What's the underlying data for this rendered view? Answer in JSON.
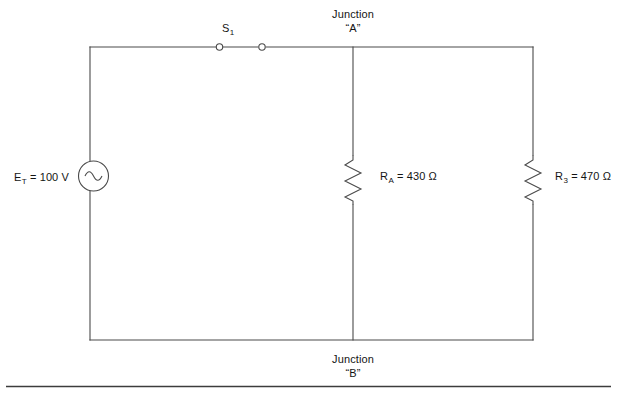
{
  "diagram": {
    "line_color": "#4a4a4a",
    "text_color": "#141414",
    "background": "#ffffff",
    "junctions": {
      "top": {
        "name_line": "Junction",
        "label_line": "“A”"
      },
      "bottom": {
        "name_line": "Junction",
        "label_line": "“B”"
      }
    },
    "source": {
      "symbol": "ac-source",
      "designator": "E",
      "designator_sub": "T",
      "equals": " = ",
      "value": "100 V",
      "full_label": "E_T = 100 V"
    },
    "switch": {
      "designator": "S",
      "designator_sub": "1",
      "state": "closed",
      "full_label": "S_1"
    },
    "resistors": [
      {
        "designator": "R",
        "designator_sub": "A",
        "equals": " = ",
        "value": "430 Ω",
        "full_label": "R_A = 430 Ω"
      },
      {
        "designator": "R",
        "designator_sub": "3",
        "equals": " = ",
        "value": "470 Ω",
        "full_label": "R_3 = 470 Ω"
      }
    ]
  }
}
